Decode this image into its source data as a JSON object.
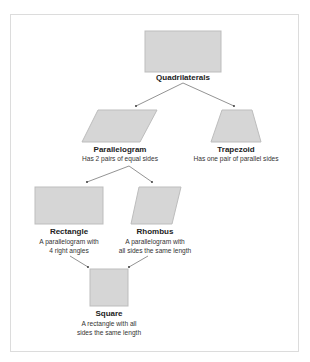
{
  "colors": {
    "shape_fill": "#d6d6d6",
    "shape_stroke": "#bdbdbd",
    "arrow": "#777777",
    "frame_border": "#dcdcdc"
  },
  "nodes": {
    "quadrilaterals": {
      "title": "Quadrilaterals",
      "desc": []
    },
    "parallelogram": {
      "title": "Parallelogram",
      "desc": [
        "Has 2 pairs of equal sides"
      ]
    },
    "trapezoid": {
      "title": "Trapezoid",
      "desc": [
        "Has one pair of parallel sides"
      ]
    },
    "rectangle": {
      "title": "Rectangle",
      "desc": [
        "A parallelogram with",
        "4 right angles"
      ]
    },
    "rhombus": {
      "title": "Rhombus",
      "desc": [
        "A parallelogram with",
        "all sides the same length"
      ]
    },
    "square": {
      "title": "Square",
      "desc": [
        "A rectangle with all",
        "sides the same length"
      ]
    }
  },
  "edges": [
    {
      "from": "quadrilaterals",
      "to": "parallelogram"
    },
    {
      "from": "quadrilaterals",
      "to": "trapezoid"
    },
    {
      "from": "parallelogram",
      "to": "rectangle"
    },
    {
      "from": "parallelogram",
      "to": "rhombus"
    },
    {
      "from": "rectangle",
      "to": "square"
    },
    {
      "from": "rhombus",
      "to": "square"
    }
  ]
}
